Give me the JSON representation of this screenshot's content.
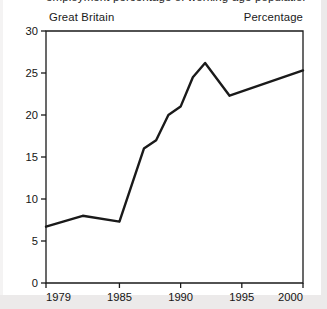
{
  "figure": {
    "title_clipped": "employment percentage of working-age population",
    "region_label": "Great Britain",
    "unit_label": "Percentage"
  },
  "chart_data": {
    "type": "line",
    "title": "",
    "xlabel": "",
    "ylabel": "",
    "unit": "Percentage",
    "region": "Great Britain",
    "grid": false,
    "legend": "none",
    "xlim": [
      1979,
      2000
    ],
    "ylim": [
      0,
      30
    ],
    "xticks": [
      1979,
      1985,
      1990,
      1995,
      2000
    ],
    "xtick_labels": [
      "1979",
      "1985",
      "1990",
      "1995",
      "2000"
    ],
    "yticks": [
      0,
      5,
      10,
      15,
      20,
      25,
      30
    ],
    "ytick_labels": [
      "0",
      "5",
      "10",
      "15",
      "20",
      "25",
      "30"
    ],
    "line_color": "#1a1a1a",
    "line_width": 2.4,
    "x": [
      1979,
      1982,
      1985,
      1987,
      1988,
      1989,
      1990,
      1991,
      1992,
      1994,
      2000
    ],
    "values": [
      6.7,
      8.0,
      7.3,
      16.0,
      17.0,
      20.0,
      21.0,
      24.5,
      26.2,
      22.3,
      25.3
    ],
    "series": [
      {
        "name": "Great Britain",
        "x": [
          1979,
          1982,
          1985,
          1987,
          1988,
          1989,
          1990,
          1991,
          1992,
          1994,
          2000
        ],
        "values": [
          6.7,
          8.0,
          7.3,
          16.0,
          17.0,
          20.0,
          21.0,
          24.5,
          26.2,
          22.3,
          25.3
        ]
      }
    ],
    "annotations": []
  }
}
